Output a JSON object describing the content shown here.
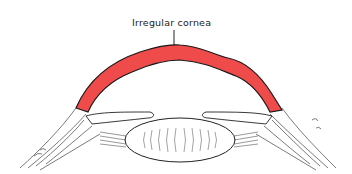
{
  "diagram": {
    "title": "Irregular cornea",
    "labels": [
      {
        "text": "Irregular cornea",
        "points_to": "cornea"
      }
    ],
    "parts": [
      "cornea",
      "lens",
      "iris",
      "ciliary-body",
      "sclera"
    ],
    "colors": {
      "cornea": "#ef4b4b",
      "outline": "#1a1a1a",
      "background": "#ffffff"
    }
  }
}
